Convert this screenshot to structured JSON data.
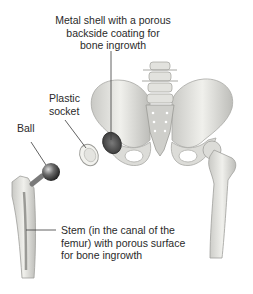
{
  "figure": {
    "labels": {
      "metal_shell": "Metal shell with a porous\nbackside coating for\nbone ingrowth",
      "plastic_socket": "Plastic\nsocket",
      "ball": "Ball",
      "stem": "Stem (in the canal of the\nfemur) with porous surface\nfor bone ingrowth"
    },
    "parts": [
      "pelvis",
      "lumbar-spine",
      "sacrum",
      "metal-shell",
      "plastic-socket",
      "ball",
      "femoral-stem",
      "right-femur"
    ],
    "colors": {
      "bone": "#e6e6e2",
      "bone_shadow": "#b8b8b4",
      "metal": "#4a4a4a",
      "leader_line": "#3a3a3a",
      "text": "#2a2a2a"
    }
  }
}
